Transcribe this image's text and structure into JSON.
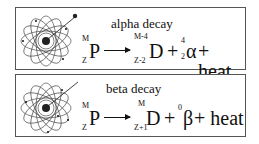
{
  "panels": [
    {
      "title": "alpha decay",
      "parent": {
        "symbol": "P",
        "mass": "M",
        "atomic": "Z"
      },
      "daughter": {
        "symbol": "D",
        "mass": "M-4",
        "atomic": "Z-2"
      },
      "plus1": "+",
      "particle": {
        "symbol": "α",
        "mass": "4",
        "atomic": "2"
      },
      "plus2": "+ heat"
    },
    {
      "title": "beta decay",
      "parent": {
        "symbol": "P",
        "mass": "M",
        "atomic": "Z"
      },
      "daughter": {
        "symbol": "D",
        "mass": "M",
        "atomic": "Z+1"
      },
      "plus1": "+",
      "particle": {
        "symbol": "β",
        "mass": "0",
        "atomic": ""
      },
      "plus2": "+ heat"
    }
  ],
  "icons": {
    "atom": "atom-orbit-icon",
    "arrow": "reaction-arrow"
  }
}
